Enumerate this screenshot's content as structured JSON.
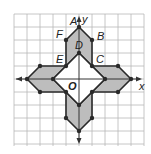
{
  "figure": {
    "type": "coordinate-plane-diagram",
    "grid": {
      "min": -5,
      "max": 5,
      "unit_px": 13,
      "origin_px": [
        79,
        79
      ]
    },
    "axes": {
      "x_label": "x",
      "y_label": "y",
      "origin_label": "O"
    },
    "colors": {
      "grid": "#b8b8b8",
      "axis": "#333333",
      "outline": "#2a2a2a",
      "shade": "#bdbdbd",
      "center": "#ffffff",
      "background": "#ffffff"
    },
    "points": [
      {
        "label": "A",
        "x": 0,
        "y": 4
      },
      {
        "label": "B",
        "x": 1,
        "y": 3
      },
      {
        "label": "C",
        "x": 1,
        "y": 1
      },
      {
        "label": "D",
        "x": 0,
        "y": 2
      },
      {
        "label": "E",
        "x": -1,
        "y": 1
      },
      {
        "label": "F",
        "x": -1,
        "y": 3
      }
    ],
    "shapes": [
      {
        "name": "top-arrow",
        "shaded": true,
        "vertices": [
          [
            0,
            4
          ],
          [
            1,
            3
          ],
          [
            1,
            1
          ],
          [
            0,
            2
          ],
          [
            -1,
            1
          ],
          [
            -1,
            3
          ]
        ]
      },
      {
        "name": "right-arrow",
        "shaded": true,
        "vertices": [
          [
            4,
            0
          ],
          [
            3,
            -1
          ],
          [
            1,
            -1
          ],
          [
            2,
            0
          ],
          [
            1,
            1
          ],
          [
            3,
            1
          ]
        ]
      },
      {
        "name": "bottom-arrow",
        "shaded": true,
        "vertices": [
          [
            0,
            -4
          ],
          [
            -1,
            -3
          ],
          [
            -1,
            -1
          ],
          [
            0,
            -2
          ],
          [
            1,
            -1
          ],
          [
            1,
            -3
          ]
        ]
      },
      {
        "name": "left-arrow",
        "shaded": true,
        "vertices": [
          [
            -4,
            0
          ],
          [
            -3,
            1
          ],
          [
            -1,
            1
          ],
          [
            -2,
            0
          ],
          [
            -1,
            -1
          ],
          [
            -3,
            -1
          ]
        ]
      },
      {
        "name": "center-square",
        "shaded": false,
        "vertices": [
          [
            0,
            2
          ],
          [
            2,
            0
          ],
          [
            0,
            -2
          ],
          [
            -2,
            0
          ]
        ]
      }
    ]
  }
}
